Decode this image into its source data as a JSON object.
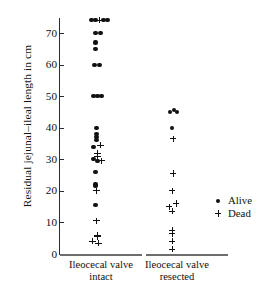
{
  "chart_data": {
    "type": "scatter",
    "title": "",
    "xlabel": "",
    "ylabel": "Residual jejunal–ileal length in cm",
    "ylim": [
      0,
      76
    ],
    "yticks": [
      0,
      10,
      20,
      30,
      40,
      50,
      60,
      70
    ],
    "ytick_labels": [
      "0",
      "10",
      "20",
      "30",
      "40",
      "50",
      "60",
      "70"
    ],
    "grid": false,
    "categories": [
      "Ileocecal valve intact",
      "Ileocecal valve resected"
    ],
    "legend": {
      "position": "right",
      "entries": [
        {
          "marker": "dot",
          "label": "Alive"
        },
        {
          "marker": "plus",
          "label": "Dead"
        }
      ]
    },
    "series": [
      {
        "name": "Alive",
        "marker": "dot",
        "groups": [
          {
            "category": "Ileocecal valve intact",
            "values": [
              74,
              74,
              74,
              74,
              70,
              70,
              67,
              65,
              60,
              60,
              50,
              50,
              50,
              40,
              38,
              37,
              36,
              34,
              30,
              29.5,
              26,
              22,
              21.5,
              15.5
            ]
          },
          {
            "category": "Ileocecal valve resected",
            "values": [
              45.5,
              45,
              45,
              40
            ]
          }
        ]
      },
      {
        "name": "Dead",
        "marker": "plus",
        "groups": [
          {
            "category": "Ileocecal valve intact",
            "values": [
              74,
              34.5,
              32,
              31,
              29.5,
              20,
              10.5,
              6,
              5.5,
              4,
              3.5
            ]
          },
          {
            "category": "Ileocecal valve resected",
            "values": [
              36.5,
              25.5,
              20,
              16,
              15,
              13.5,
              7.5,
              6.5,
              4,
              1.5
            ]
          }
        ]
      }
    ],
    "points": [
      {
        "group": 0,
        "status": "Alive",
        "value": 74,
        "offset": -6
      },
      {
        "group": 0,
        "status": "Alive",
        "value": 74,
        "offset": -2
      },
      {
        "group": 0,
        "status": "Dead",
        "value": 74,
        "offset": 2
      },
      {
        "group": 0,
        "status": "Alive",
        "value": 74,
        "offset": 6
      },
      {
        "group": 0,
        "status": "Alive",
        "value": 74,
        "offset": 10
      },
      {
        "group": 0,
        "status": "Alive",
        "value": 70,
        "offset": -2
      },
      {
        "group": 0,
        "status": "Alive",
        "value": 70,
        "offset": 3
      },
      {
        "group": 0,
        "status": "Alive",
        "value": 67,
        "offset": -2
      },
      {
        "group": 0,
        "status": "Alive",
        "value": 65,
        "offset": -2
      },
      {
        "group": 0,
        "status": "Alive",
        "value": 60,
        "offset": -3
      },
      {
        "group": 0,
        "status": "Alive",
        "value": 60,
        "offset": 2
      },
      {
        "group": 0,
        "status": "Alive",
        "value": 50,
        "offset": -4
      },
      {
        "group": 0,
        "status": "Alive",
        "value": 50,
        "offset": 0
      },
      {
        "group": 0,
        "status": "Alive",
        "value": 50,
        "offset": 4
      },
      {
        "group": 0,
        "status": "Alive",
        "value": 40,
        "offset": -1
      },
      {
        "group": 0,
        "status": "Alive",
        "value": 38,
        "offset": -1
      },
      {
        "group": 0,
        "status": "Alive",
        "value": 37,
        "offset": -1
      },
      {
        "group": 0,
        "status": "Alive",
        "value": 36,
        "offset": -1
      },
      {
        "group": 0,
        "status": "Alive",
        "value": 34,
        "offset": -4
      },
      {
        "group": 0,
        "status": "Dead",
        "value": 34.5,
        "offset": 3
      },
      {
        "group": 0,
        "status": "Dead",
        "value": 32,
        "offset": 0
      },
      {
        "group": 0,
        "status": "Dead",
        "value": 31,
        "offset": 0
      },
      {
        "group": 0,
        "status": "Alive",
        "value": 30,
        "offset": -4
      },
      {
        "group": 0,
        "status": "Alive",
        "value": 29.5,
        "offset": 0
      },
      {
        "group": 0,
        "status": "Dead",
        "value": 29.5,
        "offset": 4
      },
      {
        "group": 0,
        "status": "Alive",
        "value": 26,
        "offset": -2
      },
      {
        "group": 0,
        "status": "Alive",
        "value": 22,
        "offset": -2
      },
      {
        "group": 0,
        "status": "Alive",
        "value": 21.5,
        "offset": -2
      },
      {
        "group": 0,
        "status": "Dead",
        "value": 20,
        "offset": -1
      },
      {
        "group": 0,
        "status": "Alive",
        "value": 15.5,
        "offset": -2
      },
      {
        "group": 0,
        "status": "Dead",
        "value": 10.5,
        "offset": -1
      },
      {
        "group": 0,
        "status": "Dead",
        "value": 6,
        "offset": 0
      },
      {
        "group": 0,
        "status": "Dead",
        "value": 5.5,
        "offset": 0
      },
      {
        "group": 0,
        "status": "Dead",
        "value": 4,
        "offset": -5
      },
      {
        "group": 0,
        "status": "Dead",
        "value": 3.5,
        "offset": 1
      },
      {
        "group": 1,
        "status": "Alive",
        "value": 45.5,
        "offset": 2
      },
      {
        "group": 1,
        "status": "Alive",
        "value": 45,
        "offset": -2
      },
      {
        "group": 1,
        "status": "Alive",
        "value": 45,
        "offset": 5
      },
      {
        "group": 1,
        "status": "Alive",
        "value": 40,
        "offset": 0
      },
      {
        "group": 1,
        "status": "Dead",
        "value": 36.5,
        "offset": 1
      },
      {
        "group": 1,
        "status": "Dead",
        "value": 25.5,
        "offset": 1
      },
      {
        "group": 1,
        "status": "Dead",
        "value": 20,
        "offset": 0
      },
      {
        "group": 1,
        "status": "Dead",
        "value": 16,
        "offset": 4
      },
      {
        "group": 1,
        "status": "Dead",
        "value": 15,
        "offset": -3
      },
      {
        "group": 1,
        "status": "Dead",
        "value": 13.5,
        "offset": 0
      },
      {
        "group": 1,
        "status": "Dead",
        "value": 7.5,
        "offset": 0
      },
      {
        "group": 1,
        "status": "Dead",
        "value": 6.5,
        "offset": 0
      },
      {
        "group": 1,
        "status": "Dead",
        "value": 4,
        "offset": 0
      },
      {
        "group": 1,
        "status": "Dead",
        "value": 1.5,
        "offset": 0
      }
    ]
  },
  "axis": {
    "ylabel": "Residual jejunal–ileal length in cm"
  },
  "xlabels": [
    {
      "line1": "Ileocecal valve",
      "line2": "intact"
    },
    {
      "line1": "Ileocecal valve",
      "line2": "resected"
    }
  ],
  "legend": {
    "alive": "Alive",
    "dead": "Dead"
  }
}
